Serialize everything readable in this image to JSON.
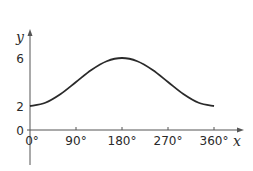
{
  "chart_data": {
    "type": "line",
    "title": "",
    "xlabel": "x",
    "ylabel": "y",
    "xlim": [
      0,
      360
    ],
    "ylim": [
      0,
      6
    ],
    "x_ticks": [
      {
        "value": 0,
        "label": "0°"
      },
      {
        "value": 90,
        "label": "90°"
      },
      {
        "value": 180,
        "label": "180°"
      },
      {
        "value": 270,
        "label": "270°"
      },
      {
        "value": 360,
        "label": "360°"
      }
    ],
    "y_ticks": [
      {
        "value": 0,
        "label": "0"
      },
      {
        "value": 2,
        "label": "2"
      },
      {
        "value": 6,
        "label": "6"
      }
    ],
    "grid": false,
    "legend": "none",
    "series": [
      {
        "name": "y = 4 - 2cos x",
        "x": [
          0,
          30,
          60,
          90,
          120,
          150,
          180,
          210,
          240,
          270,
          300,
          330,
          360
        ],
        "values": [
          2,
          2.27,
          3,
          4,
          5,
          5.73,
          6,
          5.73,
          5,
          4,
          3,
          2.27,
          2
        ]
      }
    ]
  }
}
